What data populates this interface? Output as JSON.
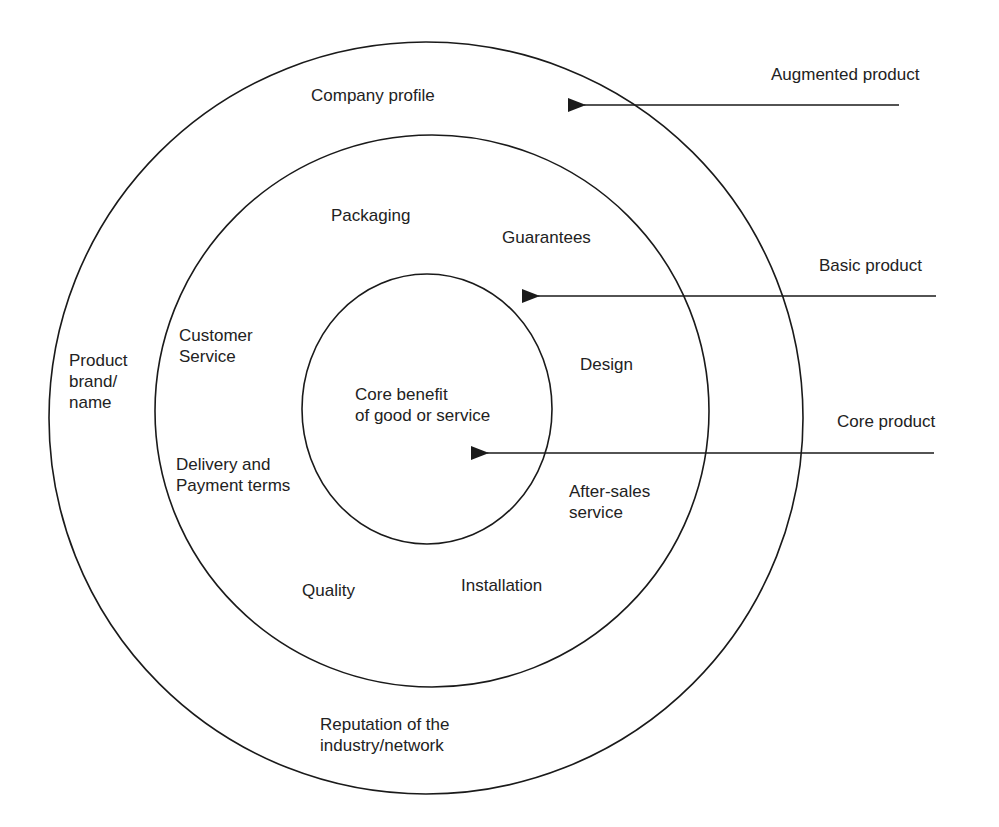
{
  "diagram": {
    "type": "concentric-levels-of-product",
    "rings": {
      "augmented": {
        "labels": [
          "Company profile",
          "Product brand/ name",
          "Reputation of the industry/network"
        ]
      },
      "basic": {
        "labels": [
          "Packaging",
          "Guarantees",
          "Customer Service",
          "Design",
          "Delivery and Payment terms",
          "After-sales service",
          "Quality",
          "Installation"
        ]
      },
      "core": {
        "labels": [
          "Core benefit of good or service"
        ]
      }
    },
    "text": {
      "company_profile": "Company profile",
      "product_brand_l1": "Product",
      "product_brand_l2": "brand/",
      "product_brand_l3": "name",
      "reputation_l1": "Reputation of the",
      "reputation_l2": "industry/network",
      "packaging": "Packaging",
      "guarantees": "Guarantees",
      "customer_service_l1": "Customer",
      "customer_service_l2": "Service",
      "design": "Design",
      "delivery_l1": "Delivery and",
      "delivery_l2": "Payment terms",
      "after_sales_l1": "After-sales",
      "after_sales_l2": "service",
      "quality": "Quality",
      "installation": "Installation",
      "core_l1": "Core benefit",
      "core_l2": "of good or service"
    },
    "arrows": [
      {
        "label": "Augmented product",
        "target": "outer ring"
      },
      {
        "label": "Basic product",
        "target": "middle ring"
      },
      {
        "label": "Core product",
        "target": "inner circle"
      }
    ],
    "colors": {
      "line": "#1a1a1a",
      "background": "#ffffff",
      "text": "#222222"
    }
  }
}
